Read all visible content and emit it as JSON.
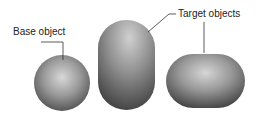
{
  "labels": {
    "base": "Base object",
    "target": "Target objects"
  },
  "objects": [
    {
      "name": "sphere",
      "role": "base"
    },
    {
      "name": "tall-capsule",
      "role": "target"
    },
    {
      "name": "flat-capsule",
      "role": "target"
    }
  ]
}
